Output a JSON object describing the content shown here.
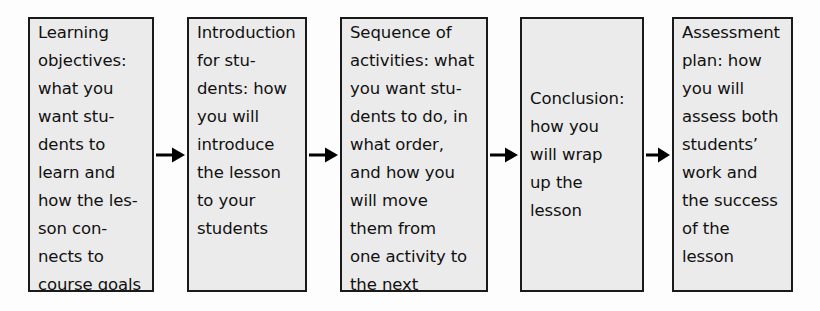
{
  "diagram": {
    "type": "linear-process-flow",
    "colors": {
      "box_fill": "#ebebeb",
      "box_border": "#1a1a1a",
      "text": "#111111",
      "arrow": "#000000",
      "page_background": "#fdfdfd"
    },
    "boxes": [
      {
        "id": "learning-objectives",
        "label": "Learning objectives",
        "text": "Learning\nobjectives:\nwhat you\nwant stu-\ndents to\nlearn and\nhow the les-\nson con-\nnects to\ncourse goals",
        "align": "top",
        "x": 28,
        "y": 17,
        "width": 126,
        "height": 275
      },
      {
        "id": "introduction",
        "label": "Introduction for students",
        "text": "Introduction\nfor stu-\ndents: how\nyou will\nintroduce\nthe lesson\nto your\nstudents",
        "align": "top",
        "x": 187,
        "y": 17,
        "width": 120,
        "height": 275
      },
      {
        "id": "sequence-of-activities",
        "label": "Sequence of activities",
        "text": "Sequence of\nactivities: what\nyou want stu-\ndents to do, in\nwhat order,\nand how you\nwill move\nthem from\none activity to\nthe next",
        "align": "top",
        "x": 340,
        "y": 17,
        "width": 148,
        "height": 275
      },
      {
        "id": "conclusion",
        "label": "Conclusion",
        "text": "Conclusion:\nhow you\nwill wrap\nup the\nlesson",
        "align": "center",
        "x": 520,
        "y": 17,
        "width": 124,
        "height": 275
      },
      {
        "id": "assessment-plan",
        "label": "Assessment plan",
        "text": "Assessment\nplan: how\nyou will\nassess both\nstudents’\nwork and\nthe success\nof the\nlesson",
        "align": "top",
        "x": 672,
        "y": 17,
        "width": 121,
        "height": 275
      }
    ],
    "arrows": [
      {
        "id": "arrow-1",
        "from": "learning-objectives",
        "to": "introduction",
        "x": 156,
        "y": 144,
        "width": 29
      },
      {
        "id": "arrow-2",
        "from": "introduction",
        "to": "sequence-of-activities",
        "x": 309,
        "y": 144,
        "width": 29
      },
      {
        "id": "arrow-3",
        "from": "sequence-of-activities",
        "to": "conclusion",
        "x": 490,
        "y": 144,
        "width": 28
      },
      {
        "id": "arrow-4",
        "from": "conclusion",
        "to": "assessment-plan",
        "x": 646,
        "y": 144,
        "width": 24
      }
    ]
  }
}
